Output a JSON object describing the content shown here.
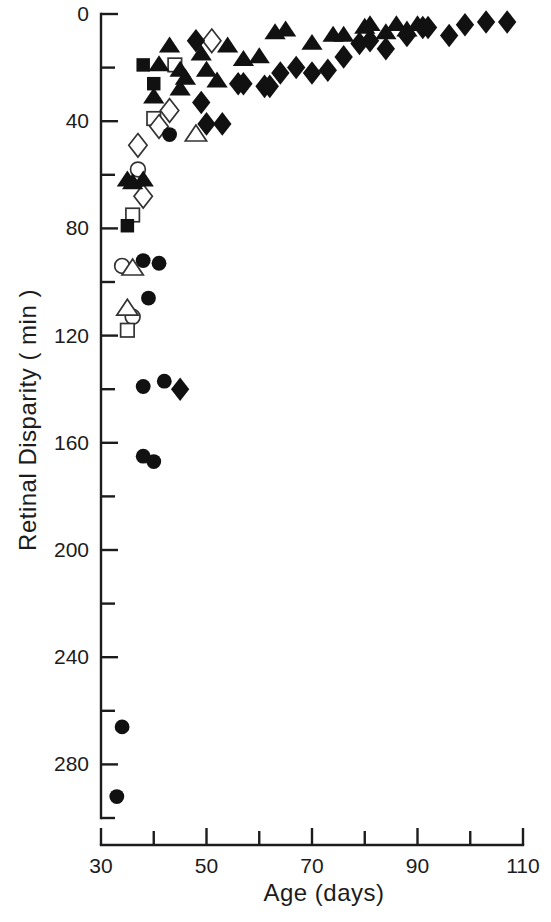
{
  "figure": {
    "background": "#ffffff",
    "ink_color": "#111111"
  },
  "chart_data": {
    "type": "scatter",
    "title": "",
    "xlabel": "Age  (days)",
    "ylabel": "Retinal  Disparity  ( min )",
    "xlabel_parts": {
      "name": "Age",
      "unit": "(days)"
    },
    "ylabel_parts": {
      "name": "Retinal  Disparity",
      "unit": "( min )"
    },
    "xlim": [
      30,
      110
    ],
    "ylim": [
      0,
      300
    ],
    "y_inverted": true,
    "grid": false,
    "legend": "none",
    "x_major_ticks": [
      30,
      50,
      70,
      90,
      110
    ],
    "x_minor_ticks": [
      40,
      60,
      80,
      100
    ],
    "x_tick_labels": [
      "30",
      "50",
      "70",
      "90",
      "110"
    ],
    "y_major_ticks": [
      0,
      40,
      80,
      120,
      160,
      200,
      240,
      280
    ],
    "y_minor_ticks": [
      20,
      60,
      100,
      140,
      180,
      220,
      260,
      300
    ],
    "y_tick_labels": [
      "0",
      "40",
      "80",
      "120",
      "160",
      "200",
      "240",
      "280"
    ],
    "marker_kinds": [
      "filled-circle",
      "open-circle",
      "filled-triangle",
      "open-triangle",
      "filled-square",
      "open-square",
      "filled-diamond",
      "open-diamond"
    ],
    "series": [
      {
        "name": "filled-circle",
        "marker": "filled-circle",
        "points": [
          [
            33,
            292
          ],
          [
            34,
            266
          ],
          [
            38,
            165
          ],
          [
            40,
            167
          ],
          [
            38,
            139
          ],
          [
            42,
            137
          ],
          [
            39,
            106
          ],
          [
            41,
            93
          ],
          [
            38,
            92
          ],
          [
            43,
            45
          ]
        ]
      },
      {
        "name": "open-circle",
        "marker": "open-circle",
        "points": [
          [
            34,
            94
          ],
          [
            36,
            113
          ],
          [
            37,
            58
          ]
        ]
      },
      {
        "name": "filled-triangle",
        "marker": "filled-triangle",
        "points": [
          [
            35,
            62
          ],
          [
            36,
            63
          ],
          [
            38,
            62
          ],
          [
            40,
            31
          ],
          [
            41,
            19
          ],
          [
            43,
            12
          ],
          [
            45,
            21
          ],
          [
            45,
            28
          ],
          [
            46,
            24
          ],
          [
            49,
            15
          ],
          [
            50,
            21
          ],
          [
            52,
            25
          ],
          [
            54,
            12
          ],
          [
            57,
            17
          ],
          [
            60,
            16
          ],
          [
            63,
            7
          ],
          [
            65,
            6
          ],
          [
            70,
            11
          ],
          [
            74,
            8
          ],
          [
            76,
            8
          ],
          [
            80,
            5
          ],
          [
            81,
            4
          ],
          [
            84,
            7
          ],
          [
            86,
            4
          ],
          [
            88,
            6
          ],
          [
            90,
            4
          ]
        ]
      },
      {
        "name": "open-triangle",
        "marker": "open-triangle",
        "points": [
          [
            36,
            95
          ],
          [
            35,
            110
          ],
          [
            48,
            45
          ]
        ]
      },
      {
        "name": "filled-square",
        "marker": "filled-square",
        "points": [
          [
            38,
            19
          ],
          [
            40,
            26
          ],
          [
            35,
            79
          ]
        ]
      },
      {
        "name": "open-square",
        "marker": "open-square",
        "points": [
          [
            44,
            19
          ],
          [
            40,
            39
          ],
          [
            36,
            75
          ],
          [
            35,
            118
          ]
        ]
      },
      {
        "name": "filled-diamond",
        "marker": "filled-diamond",
        "points": [
          [
            48,
            10
          ],
          [
            49,
            33
          ],
          [
            50,
            41
          ],
          [
            53,
            41
          ],
          [
            45,
            140
          ],
          [
            56,
            26
          ],
          [
            57,
            26
          ],
          [
            61,
            27
          ],
          [
            62,
            27
          ],
          [
            64,
            22
          ],
          [
            67,
            20
          ],
          [
            70,
            22
          ],
          [
            73,
            21
          ],
          [
            76,
            16
          ],
          [
            79,
            11
          ],
          [
            81,
            10
          ],
          [
            84,
            13
          ],
          [
            88,
            8
          ],
          [
            91,
            5
          ],
          [
            92,
            5
          ],
          [
            96,
            8
          ],
          [
            99,
            4
          ],
          [
            103,
            3
          ],
          [
            107,
            3
          ]
        ]
      },
      {
        "name": "open-diamond",
        "marker": "open-diamond",
        "points": [
          [
            51,
            10
          ],
          [
            43,
            36
          ],
          [
            41,
            42
          ],
          [
            37,
            49
          ],
          [
            38,
            68
          ]
        ]
      }
    ]
  }
}
